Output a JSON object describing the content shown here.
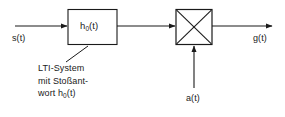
{
  "diagram": {
    "type": "block-diagram",
    "background_color": "#ffffff",
    "line_color": "#1a1a1a",
    "text_color": "#1a1a1a",
    "signals": {
      "input_label": "s(t)",
      "output_label": "g(t)",
      "aux_input_label": "a(t)"
    },
    "blocks": [
      {
        "id": "lti-block",
        "name": "lti-system-block",
        "shape": "rectangle",
        "label_main": "h",
        "label_sub": "0",
        "label_tail": "(t)"
      },
      {
        "id": "multiplier-block",
        "name": "multiplier-block",
        "shape": "square-with-cross",
        "label_main": "",
        "label_sub": "",
        "label_tail": ""
      }
    ],
    "callout": {
      "line1": "LTI-System",
      "line2": "mit Stoßant-",
      "line3_prefix": "wort h",
      "line3_sub": "0",
      "line3_suffix": "(t)"
    }
  }
}
